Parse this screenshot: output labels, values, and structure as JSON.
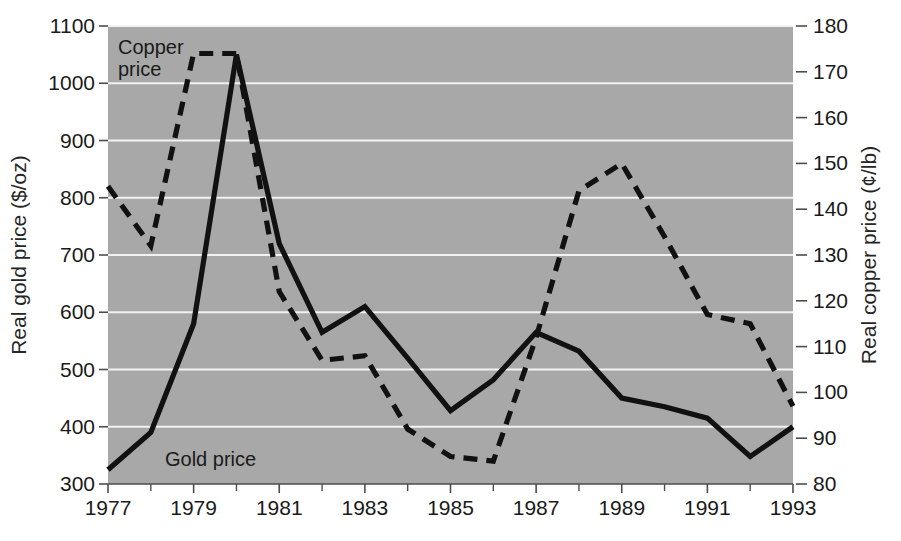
{
  "chart_data": {
    "type": "line",
    "title": "",
    "xlabel": "",
    "ylabel": "Real gold price ($/oz)",
    "y2label": "Real copper price (¢/lb)",
    "x": [
      1977,
      1978,
      1979,
      1980,
      1981,
      1982,
      1983,
      1984,
      1985,
      1986,
      1987,
      1988,
      1989,
      1990,
      1991,
      1992,
      1993
    ],
    "xlim": [
      1977,
      1993
    ],
    "ylim": [
      300,
      1100
    ],
    "y2lim": [
      80,
      180
    ],
    "grid": true,
    "legend_position": "inline-annotation",
    "x_tick_labels": [
      "1977",
      "1979",
      "1981",
      "1983",
      "1985",
      "1987",
      "1989",
      "1991",
      "1993"
    ],
    "x_tick_values": [
      1977,
      1979,
      1981,
      1983,
      1985,
      1987,
      1989,
      1991,
      1993
    ],
    "x_minor_tick_values": [
      1978,
      1980,
      1982,
      1984,
      1986,
      1988,
      1990,
      1992
    ],
    "y_tick_labels": [
      "300",
      "400",
      "500",
      "600",
      "700",
      "800",
      "900",
      "1000",
      "1100"
    ],
    "y_tick_values": [
      300,
      400,
      500,
      600,
      700,
      800,
      900,
      1000,
      1100
    ],
    "y2_tick_labels": [
      "80",
      "90",
      "100",
      "110",
      "120",
      "130",
      "140",
      "150",
      "160",
      "170",
      "180"
    ],
    "y2_tick_values": [
      80,
      90,
      100,
      110,
      120,
      130,
      140,
      150,
      160,
      170,
      180
    ],
    "series": [
      {
        "name": "Gold price",
        "axis": "left",
        "style": "solid",
        "color": "#111111",
        "label_text": "Gold price",
        "values": [
          325,
          390,
          580,
          1050,
          720,
          565,
          610,
          520,
          428,
          482,
          565,
          532,
          450,
          435,
          415,
          348,
          400
        ]
      },
      {
        "name": "Copper price",
        "axis": "right",
        "style": "dashed",
        "color": "#111111",
        "label_text": "Copper price",
        "values": [
          145,
          132,
          174,
          174,
          122,
          107,
          108,
          92,
          86,
          85,
          112,
          144,
          150,
          134,
          117,
          115,
          97
        ]
      }
    ],
    "colors": {
      "plot_background": "#a8a8a8",
      "gridline": "#f2f2f2",
      "axis": "#4d4d4d",
      "text": "#1a1a1a"
    }
  },
  "annotations": {
    "copper_label_line1": "Copper",
    "copper_label_line2": "price",
    "gold_label": "Gold price"
  }
}
